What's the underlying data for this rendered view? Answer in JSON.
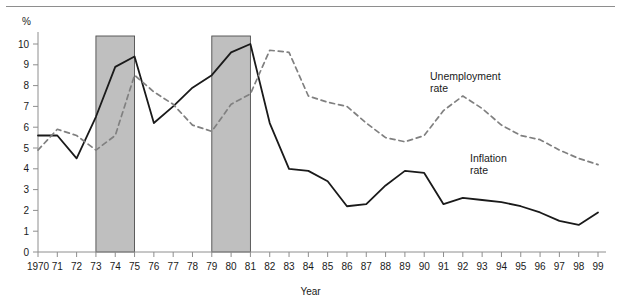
{
  "figure": {
    "y_axis_unit": "%",
    "x_axis_title": "Year"
  },
  "annotations": {
    "unemployment": "Unemployment\nrate",
    "unemployment_line1": "Unemployment",
    "unemployment_line2": "rate",
    "inflation_line1": "Inflation",
    "inflation_line2": "rate"
  },
  "colors": {
    "inflation_line": "#1a1a1a",
    "unemployment_line": "#808080",
    "recession_band": "#bfbfbf",
    "axis": "#8e8e8e",
    "text": "#1a1a1a"
  },
  "chart_data": {
    "type": "line",
    "title": "",
    "xlabel": "Year",
    "ylabel": "%",
    "ylim": [
      0,
      10.6
    ],
    "xlim": [
      1970,
      1999
    ],
    "grid": false,
    "legend": "inline-annotations",
    "yticks": [
      0,
      1,
      2,
      3,
      4,
      5,
      6,
      7,
      8,
      9,
      10
    ],
    "ytick_labels": [
      "0",
      "1",
      "2",
      "3",
      "4",
      "5",
      "6",
      "7",
      "8",
      "9",
      "10"
    ],
    "x": [
      1970,
      1971,
      1972,
      1973,
      1974,
      1975,
      1976,
      1977,
      1978,
      1979,
      1980,
      1981,
      1982,
      1983,
      1984,
      1985,
      1986,
      1987,
      1988,
      1989,
      1990,
      1991,
      1992,
      1993,
      1994,
      1995,
      1996,
      1997,
      1998,
      1999
    ],
    "xtick_labels": [
      "1970",
      "71",
      "72",
      "73",
      "74",
      "75",
      "76",
      "77",
      "78",
      "79",
      "80",
      "81",
      "82",
      "83",
      "84",
      "85",
      "86",
      "87",
      "88",
      "89",
      "90",
      "91",
      "92",
      "93",
      "94",
      "95",
      "96",
      "97",
      "98",
      "99"
    ],
    "series": [
      {
        "name": "Inflation rate",
        "style": "solid",
        "color": "#1a1a1a",
        "values": [
          5.6,
          5.6,
          4.5,
          6.5,
          8.9,
          9.4,
          6.2,
          7.0,
          7.9,
          8.5,
          9.6,
          10.0,
          6.2,
          4.0,
          3.9,
          3.4,
          2.2,
          2.3,
          3.2,
          3.9,
          3.8,
          2.3,
          2.6,
          2.5,
          2.4,
          2.2,
          1.9,
          1.5,
          1.3,
          1.9
        ]
      },
      {
        "name": "Unemployment rate",
        "style": "dashed",
        "color": "#808080",
        "values": [
          4.9,
          5.9,
          5.6,
          4.9,
          5.6,
          8.5,
          7.7,
          7.1,
          6.1,
          5.8,
          7.1,
          7.6,
          9.7,
          9.6,
          7.5,
          7.2,
          7.0,
          6.2,
          5.5,
          5.3,
          5.6,
          6.8,
          7.5,
          6.9,
          6.1,
          5.6,
          5.4,
          4.9,
          4.5,
          4.2
        ]
      }
    ],
    "recession_bands": [
      {
        "start": 1973,
        "end": 1975,
        "color": "#bfbfbf"
      },
      {
        "start": 1979,
        "end": 1981,
        "color": "#bfbfbf"
      }
    ]
  }
}
